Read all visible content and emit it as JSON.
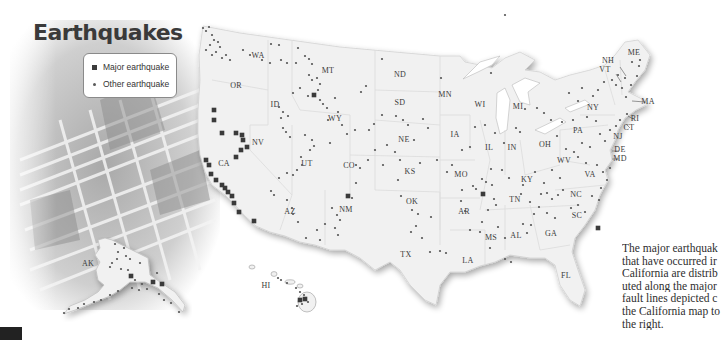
{
  "title": "Earthquakes",
  "legend": {
    "major_label": "Major earthquake",
    "other_label": "Other earthquake"
  },
  "caption": {
    "lines": [
      "The major earthquak",
      "that have occurred ir",
      "California are distrib",
      "uted along the major",
      "fault lines depicted c",
      "the California map to",
      "the right."
    ]
  },
  "colors": {
    "land": "#f1f1f1",
    "border": "#d8d8d8",
    "dot": "#555555",
    "major": "#3a3a3a",
    "label": "#3a3a3a"
  },
  "state_labels": [
    {
      "abbr": "WA",
      "x": 258,
      "y": 58
    },
    {
      "abbr": "OR",
      "x": 236,
      "y": 88
    },
    {
      "abbr": "CA",
      "x": 224,
      "y": 166
    },
    {
      "abbr": "NV",
      "x": 258,
      "y": 145
    },
    {
      "abbr": "ID",
      "x": 275,
      "y": 107
    },
    {
      "abbr": "MT",
      "x": 328,
      "y": 73
    },
    {
      "abbr": "WY",
      "x": 335,
      "y": 121
    },
    {
      "abbr": "UT",
      "x": 307,
      "y": 166
    },
    {
      "abbr": "AZ",
      "x": 290,
      "y": 214
    },
    {
      "abbr": "CO",
      "x": 349,
      "y": 168
    },
    {
      "abbr": "NM",
      "x": 346,
      "y": 212
    },
    {
      "abbr": "ND",
      "x": 400,
      "y": 77
    },
    {
      "abbr": "SD",
      "x": 400,
      "y": 105
    },
    {
      "abbr": "NE",
      "x": 404,
      "y": 142
    },
    {
      "abbr": "KS",
      "x": 410,
      "y": 174
    },
    {
      "abbr": "OK",
      "x": 412,
      "y": 204
    },
    {
      "abbr": "TX",
      "x": 406,
      "y": 257
    },
    {
      "abbr": "MN",
      "x": 445,
      "y": 97
    },
    {
      "abbr": "IA",
      "x": 455,
      "y": 137
    },
    {
      "abbr": "MO",
      "x": 461,
      "y": 177
    },
    {
      "abbr": "AR",
      "x": 464,
      "y": 214
    },
    {
      "abbr": "LA",
      "x": 468,
      "y": 263
    },
    {
      "abbr": "WI",
      "x": 480,
      "y": 107
    },
    {
      "abbr": "IL",
      "x": 489,
      "y": 150
    },
    {
      "abbr": "MI",
      "x": 518,
      "y": 109
    },
    {
      "abbr": "IN",
      "x": 512,
      "y": 150
    },
    {
      "abbr": "OH",
      "x": 545,
      "y": 147
    },
    {
      "abbr": "KY",
      "x": 527,
      "y": 182
    },
    {
      "abbr": "TN",
      "x": 515,
      "y": 202
    },
    {
      "abbr": "MS",
      "x": 491,
      "y": 240
    },
    {
      "abbr": "AL",
      "x": 516,
      "y": 238
    },
    {
      "abbr": "GA",
      "x": 551,
      "y": 236
    },
    {
      "abbr": "FL",
      "x": 566,
      "y": 278
    },
    {
      "abbr": "SC",
      "x": 577,
      "y": 218
    },
    {
      "abbr": "NC",
      "x": 576,
      "y": 197
    },
    {
      "abbr": "VA",
      "x": 590,
      "y": 177
    },
    {
      "abbr": "WV",
      "x": 564,
      "y": 163
    },
    {
      "abbr": "PA",
      "x": 578,
      "y": 133
    },
    {
      "abbr": "NY",
      "x": 593,
      "y": 110
    },
    {
      "abbr": "NJ",
      "x": 618,
      "y": 139
    },
    {
      "abbr": "DE",
      "x": 620,
      "y": 152
    },
    {
      "abbr": "MD",
      "x": 620,
      "y": 161
    },
    {
      "abbr": "CT",
      "x": 629,
      "y": 130
    },
    {
      "abbr": "RI",
      "x": 635,
      "y": 121
    },
    {
      "abbr": "MA",
      "x": 648,
      "y": 104
    },
    {
      "abbr": "VT",
      "x": 605,
      "y": 72
    },
    {
      "abbr": "NH",
      "x": 608,
      "y": 63
    },
    {
      "abbr": "ME",
      "x": 634,
      "y": 55
    },
    {
      "abbr": "AK",
      "x": 88,
      "y": 266
    },
    {
      "abbr": "HI",
      "x": 266,
      "y": 288
    }
  ],
  "major_earthquakes": [
    [
      214,
      110
    ],
    [
      214,
      120
    ],
    [
      222,
      133
    ],
    [
      236,
      133
    ],
    [
      242,
      135
    ],
    [
      243,
      140
    ],
    [
      241,
      150
    ],
    [
      236,
      157
    ],
    [
      247,
      147
    ],
    [
      206,
      160
    ],
    [
      209,
      165
    ],
    [
      211,
      174
    ],
    [
      216,
      180
    ],
    [
      222,
      185
    ],
    [
      225,
      188
    ],
    [
      228,
      192
    ],
    [
      232,
      196
    ],
    [
      234,
      203
    ],
    [
      239,
      212
    ],
    [
      254,
      221
    ],
    [
      314,
      95
    ],
    [
      348,
      196
    ],
    [
      483,
      194
    ],
    [
      598,
      228
    ],
    [
      131,
      276
    ],
    [
      153,
      282
    ],
    [
      162,
      284
    ],
    [
      300,
      300
    ],
    [
      305,
      299
    ]
  ],
  "other_earthquakes": [
    [
      203,
      28
    ],
    [
      206,
      31
    ],
    [
      209,
      27
    ],
    [
      212,
      35
    ],
    [
      214,
      40
    ],
    [
      218,
      42
    ],
    [
      220,
      47
    ],
    [
      210,
      45
    ],
    [
      206,
      50
    ],
    [
      212,
      55
    ],
    [
      216,
      52
    ],
    [
      222,
      58
    ],
    [
      226,
      55
    ],
    [
      230,
      60
    ],
    [
      243,
      50
    ],
    [
      250,
      55
    ],
    [
      262,
      60
    ],
    [
      270,
      63
    ],
    [
      271,
      44
    ],
    [
      279,
      45
    ],
    [
      281,
      60
    ],
    [
      287,
      63
    ],
    [
      296,
      63
    ],
    [
      298,
      48
    ],
    [
      305,
      56
    ],
    [
      309,
      59
    ],
    [
      312,
      64
    ],
    [
      309,
      75
    ],
    [
      312,
      80
    ],
    [
      317,
      78
    ],
    [
      320,
      84
    ],
    [
      318,
      90
    ],
    [
      320,
      100
    ],
    [
      323,
      104
    ],
    [
      308,
      96
    ],
    [
      300,
      88
    ],
    [
      293,
      93
    ],
    [
      279,
      107
    ],
    [
      283,
      112
    ],
    [
      288,
      116
    ],
    [
      281,
      118
    ],
    [
      283,
      128
    ],
    [
      286,
      132
    ],
    [
      290,
      137
    ],
    [
      305,
      135
    ],
    [
      312,
      140
    ],
    [
      314,
      146
    ],
    [
      310,
      150
    ],
    [
      301,
      157
    ],
    [
      302,
      165
    ],
    [
      297,
      170
    ],
    [
      293,
      175
    ],
    [
      287,
      173
    ],
    [
      279,
      178
    ],
    [
      271,
      191
    ],
    [
      274,
      195
    ],
    [
      287,
      200
    ],
    [
      292,
      208
    ],
    [
      293,
      214
    ],
    [
      298,
      222
    ],
    [
      306,
      238
    ],
    [
      317,
      230
    ],
    [
      320,
      240
    ],
    [
      325,
      224
    ],
    [
      332,
      208
    ],
    [
      337,
      215
    ],
    [
      340,
      220
    ],
    [
      335,
      228
    ],
    [
      338,
      235
    ],
    [
      352,
      198
    ],
    [
      356,
      183
    ],
    [
      356,
      165
    ],
    [
      360,
      168
    ],
    [
      368,
      160
    ],
    [
      375,
      150
    ],
    [
      383,
      165
    ],
    [
      387,
      145
    ],
    [
      395,
      152
    ],
    [
      400,
      160
    ],
    [
      398,
      180
    ],
    [
      401,
      196
    ],
    [
      412,
      210
    ],
    [
      418,
      214
    ],
    [
      411,
      232
    ],
    [
      422,
      238
    ],
    [
      431,
      217
    ],
    [
      416,
      226
    ],
    [
      430,
      252
    ],
    [
      440,
      251
    ],
    [
      446,
      253
    ],
    [
      461,
      201
    ],
    [
      465,
      211
    ],
    [
      473,
      186
    ],
    [
      476,
      189
    ],
    [
      482,
      179
    ],
    [
      486,
      182
    ],
    [
      491,
      169
    ],
    [
      492,
      185
    ],
    [
      494,
      199
    ],
    [
      496,
      205
    ],
    [
      488,
      210
    ],
    [
      482,
      222
    ],
    [
      498,
      227
    ],
    [
      505,
      238
    ],
    [
      523,
      224
    ],
    [
      527,
      233
    ],
    [
      531,
      225
    ],
    [
      534,
      214
    ],
    [
      530,
      202
    ],
    [
      539,
      207
    ],
    [
      541,
      194
    ],
    [
      547,
      193
    ],
    [
      552,
      199
    ],
    [
      558,
      195
    ],
    [
      563,
      190
    ],
    [
      555,
      218
    ],
    [
      571,
      208
    ],
    [
      578,
      205
    ],
    [
      585,
      212
    ],
    [
      592,
      196
    ],
    [
      599,
      200
    ],
    [
      601,
      188
    ],
    [
      607,
      180
    ],
    [
      603,
      172
    ],
    [
      610,
      168
    ],
    [
      597,
      165
    ],
    [
      586,
      163
    ],
    [
      578,
      157
    ],
    [
      574,
      152
    ],
    [
      582,
      143
    ],
    [
      590,
      147
    ],
    [
      600,
      134
    ],
    [
      605,
      141
    ],
    [
      610,
      130
    ],
    [
      616,
      126
    ],
    [
      620,
      120
    ],
    [
      627,
      114
    ],
    [
      626,
      97
    ],
    [
      622,
      88
    ],
    [
      616,
      85
    ],
    [
      612,
      80
    ],
    [
      618,
      75
    ],
    [
      625,
      78
    ],
    [
      631,
      85
    ],
    [
      637,
      76
    ],
    [
      639,
      66
    ],
    [
      640,
      60
    ],
    [
      632,
      62
    ],
    [
      604,
      82
    ],
    [
      598,
      90
    ],
    [
      593,
      96
    ],
    [
      582,
      88
    ],
    [
      578,
      101
    ],
    [
      569,
      93
    ],
    [
      551,
      120
    ],
    [
      544,
      113
    ],
    [
      537,
      108
    ],
    [
      525,
      109
    ],
    [
      520,
      132
    ],
    [
      516,
      128
    ],
    [
      504,
      143
    ],
    [
      495,
      133
    ],
    [
      485,
      125
    ],
    [
      475,
      127
    ],
    [
      470,
      147
    ],
    [
      462,
      150
    ],
    [
      452,
      165
    ],
    [
      447,
      172
    ],
    [
      437,
      160
    ],
    [
      420,
      163
    ],
    [
      408,
      125
    ],
    [
      403,
      120
    ],
    [
      396,
      116
    ],
    [
      382,
      115
    ],
    [
      374,
      124
    ],
    [
      369,
      130
    ],
    [
      355,
      130
    ],
    [
      342,
      125
    ],
    [
      347,
      134
    ],
    [
      330,
      143
    ],
    [
      328,
      120
    ],
    [
      327,
      108
    ],
    [
      338,
      112
    ],
    [
      335,
      98
    ],
    [
      361,
      92
    ],
    [
      366,
      86
    ],
    [
      382,
      59
    ],
    [
      441,
      78
    ],
    [
      505,
      15
    ],
    [
      491,
      73
    ],
    [
      414,
      140
    ],
    [
      423,
      119
    ],
    [
      428,
      128
    ],
    [
      462,
      190
    ],
    [
      470,
      230
    ],
    [
      480,
      232
    ],
    [
      490,
      248
    ],
    [
      505,
      259
    ],
    [
      511,
      262
    ],
    [
      547,
      213
    ],
    [
      552,
      170
    ],
    [
      560,
      178
    ],
    [
      566,
      149
    ],
    [
      557,
      136
    ],
    [
      562,
      122
    ],
    [
      573,
      120
    ],
    [
      596,
      121
    ],
    [
      587,
      117
    ],
    [
      535,
      172
    ],
    [
      544,
      183
    ],
    [
      521,
      194
    ],
    [
      523,
      185
    ],
    [
      509,
      178
    ],
    [
      502,
      170
    ],
    [
      115,
      244
    ],
    [
      118,
      252
    ],
    [
      124,
      248
    ],
    [
      126,
      256
    ],
    [
      130,
      259
    ],
    [
      117,
      259
    ],
    [
      112,
      263
    ],
    [
      121,
      269
    ],
    [
      128,
      270
    ],
    [
      140,
      263
    ],
    [
      135,
      280
    ],
    [
      142,
      284
    ],
    [
      147,
      289
    ],
    [
      139,
      290
    ],
    [
      132,
      288
    ],
    [
      118,
      291
    ],
    [
      110,
      295
    ],
    [
      101,
      300
    ],
    [
      94,
      302
    ],
    [
      84,
      304
    ],
    [
      78,
      308
    ],
    [
      69,
      309
    ],
    [
      64,
      313
    ],
    [
      159,
      294
    ],
    [
      164,
      300
    ],
    [
      171,
      303
    ],
    [
      179,
      312
    ],
    [
      278,
      278
    ],
    [
      281,
      280
    ],
    [
      287,
      283
    ],
    [
      296,
      288
    ],
    [
      300,
      292
    ],
    [
      304,
      295
    ],
    [
      308,
      302
    ],
    [
      302,
      304
    ],
    [
      297,
      306
    ],
    [
      110,
      267
    ],
    [
      157,
      273
    ]
  ]
}
